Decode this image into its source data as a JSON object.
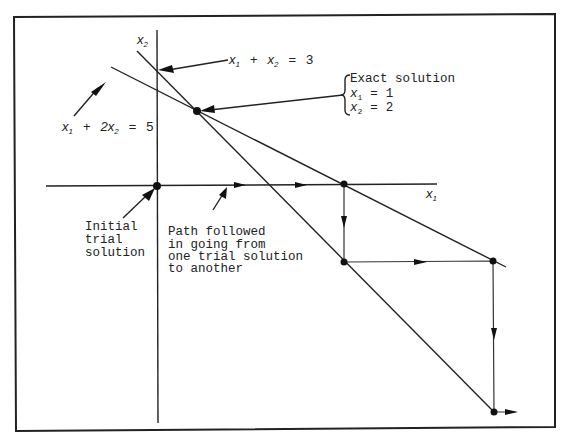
{
  "diagram": {
    "axes": {
      "x_label": "x",
      "x_label_sub": "1",
      "y_label": "x",
      "y_label_sub": "2"
    },
    "equations": [
      {
        "id": "eq1",
        "parts": [
          "x",
          "1",
          "+",
          "x",
          "2",
          "=",
          "3"
        ],
        "text": "x1 + x2 = 3"
      },
      {
        "id": "eq2",
        "parts": [
          "x",
          "1",
          "+",
          "2x",
          "2",
          "=",
          "5"
        ],
        "text": "x1 + 2x2 = 5"
      }
    ],
    "exact_solution": {
      "heading": "Exact solution",
      "x1_var": "x",
      "x1_sub": "1",
      "x1_eq": "=",
      "x1_val": "1",
      "x2_var": "x",
      "x2_sub": "2",
      "x2_eq": "=",
      "x2_val": "2"
    },
    "initial_label": {
      "lines": [
        "Initial",
        "trial",
        "solution"
      ]
    },
    "path_label": {
      "lines": [
        "Path followed",
        "in going from",
        "one trial solution",
        "to another"
      ]
    },
    "trial_points": [
      {
        "name": "initial",
        "x": 157,
        "y": 186
      },
      {
        "name": "step1",
        "x": 344,
        "y": 184
      },
      {
        "name": "step2",
        "x": 344,
        "y": 262
      },
      {
        "name": "step3",
        "x": 493,
        "y": 261
      },
      {
        "name": "step4",
        "x": 494,
        "y": 412
      }
    ],
    "exact_point": {
      "x": 197,
      "y": 111
    },
    "colors": {
      "ink": "#222222",
      "background": "#ffffff"
    }
  }
}
